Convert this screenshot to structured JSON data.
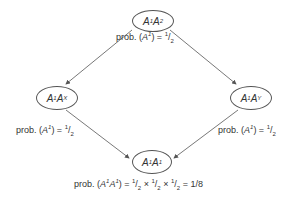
{
  "nodes": {
    "top": {
      "base1": "A",
      "sup1": "1",
      "base2": "A",
      "sup2": "2"
    },
    "left": {
      "base1": "A",
      "sup1": "1",
      "base2": "A",
      "sup2": "X"
    },
    "right": {
      "base1": "A",
      "sup1": "1",
      "base2": "A",
      "sup2": "Y"
    },
    "bottom": {
      "base1": "A",
      "sup1": "1",
      "base2": "A",
      "sup2": "1"
    }
  },
  "labels": {
    "prob_prefix": "prob.",
    "top": {
      "expr_base": "A",
      "expr_sup": "1",
      "num": "1",
      "den": "2"
    },
    "left": {
      "expr_base": "A",
      "expr_sup": "1",
      "num": "1",
      "den": "2"
    },
    "right": {
      "expr_base": "A",
      "expr_sup": "1",
      "num": "1",
      "den": "2"
    },
    "bottom": {
      "expr_base1": "A",
      "expr_sup1": "1",
      "expr_base2": "A",
      "expr_sup2": "1",
      "num": "1",
      "den": "2",
      "times": "×",
      "result": "= 1/8"
    }
  },
  "colors": {
    "line": "#555555",
    "text": "#333333"
  }
}
